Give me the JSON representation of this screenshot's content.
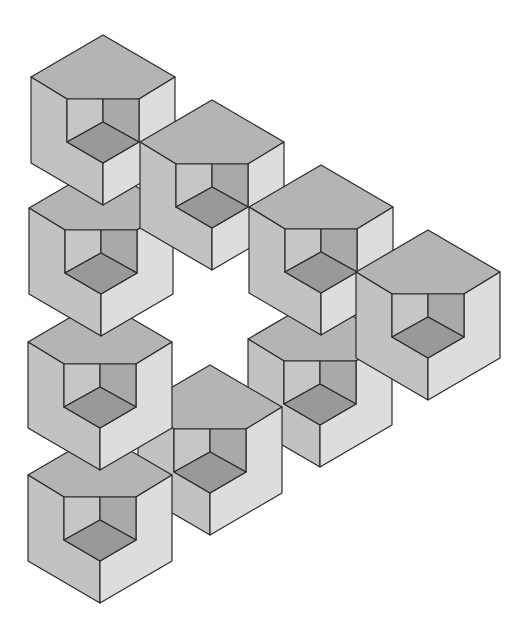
{
  "figure": {
    "title": "Impossible triangle of notched cubes",
    "canvas": {
      "width": 527,
      "height": 637,
      "background": "#ffffff"
    },
    "colors": {
      "top_face": "#b4b4b4",
      "left_face": "#c2c2c2",
      "right_face": "#dddddd",
      "notch_left_wall": "#c6c6c6",
      "notch_right_wall": "#a9a9a9",
      "notch_floor": "#999999",
      "edge": "#2a2a2a"
    },
    "cube_geometry": {
      "half_width": 72,
      "slope_drop": 42,
      "height": 86,
      "notch_scale": 0.5
    },
    "cubes": [
      {
        "id": "cube-9",
        "x": 320,
        "y": 297
      },
      {
        "id": "cube-8",
        "x": 210,
        "y": 365
      },
      {
        "id": "cube-7",
        "x": 100,
        "y": 433
      },
      {
        "id": "cube-6",
        "x": 100,
        "y": 300
      },
      {
        "id": "cube-5",
        "x": 101,
        "y": 166
      },
      {
        "id": "cube-1",
        "x": 103,
        "y": 35
      },
      {
        "id": "cube-2",
        "x": 212,
        "y": 100
      },
      {
        "id": "cube-3",
        "x": 321,
        "y": 165
      },
      {
        "id": "cube-4",
        "x": 428,
        "y": 230
      }
    ]
  }
}
